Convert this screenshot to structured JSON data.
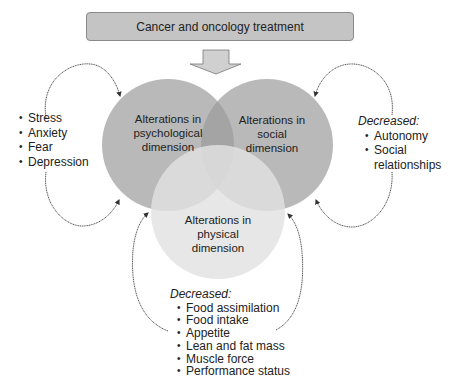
{
  "top_box": {
    "label": "Cancer and oncology treatment",
    "fill": "#c4c4c4"
  },
  "circles": [
    {
      "id": "psychological",
      "label_lines": [
        "Alterations in",
        "psychological",
        "dimension"
      ],
      "fill": "#b9b9b9"
    },
    {
      "id": "social",
      "label_lines": [
        "Alterations in",
        "social",
        "dimension"
      ],
      "fill": "#b9b9b9"
    },
    {
      "id": "physical",
      "label_lines": [
        "Alterations in",
        "physical",
        "dimension"
      ],
      "fill": "#d6d6d6"
    }
  ],
  "left_list": {
    "items": [
      "Stress",
      "Anxiety",
      "Fear",
      "Depression"
    ]
  },
  "right_list": {
    "heading": "Decreased:",
    "items": [
      "Autonomy",
      "Social",
      "relationships"
    ]
  },
  "bottom_list": {
    "heading": "Decreased:",
    "items": [
      "Food assimilation",
      "Food intake",
      "Appetite",
      "Lean and fat mass",
      "Muscle force",
      "Performance status"
    ]
  },
  "colors": {
    "overlap_lens": "#a4a4a4",
    "arrow_fill": "#d0d0d0",
    "line": "#555555"
  }
}
